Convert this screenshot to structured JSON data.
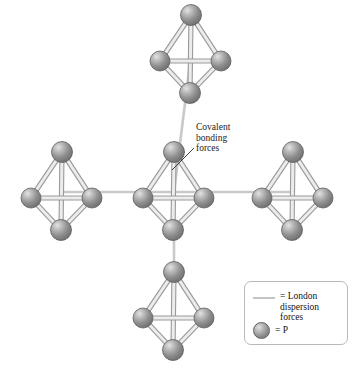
{
  "figure": {
    "background_color": "#ffffff"
  },
  "annotations": {
    "covalent": {
      "text": "Covalent\nbonding\nforces",
      "x": 196,
      "y": 122,
      "leader_from": [
        194,
        148
      ],
      "leader_to": [
        172,
        170
      ]
    }
  },
  "legend": {
    "box": {
      "x": 244,
      "y": 281,
      "width": 104,
      "height": 64,
      "border_color": "#b9b9b9"
    },
    "entries": [
      {
        "swatch": "line-swatch",
        "text": "= London\ndispersion\nforces",
        "color": "#c4c4c4"
      },
      {
        "swatch": "sphere-swatch",
        "text": "= P",
        "color": "#8c8c8c"
      }
    ]
  },
  "style": {
    "atom_fill": "#8a8a8a",
    "atom_highlight": "#d8d8d8",
    "atom_edge": "#5f5f5f",
    "bond_fill": "#d5d5d5",
    "bond_edge": "#9a9a9a",
    "intermolecular_line": "#c9c9c9",
    "text_color": "#141414"
  },
  "chart_data": {
    "type": "diagram",
    "molecule_formula": "P4",
    "molecule_geometry": "tetrahedral",
    "atoms_per_molecule": 4,
    "bonds_per_molecule": 6,
    "atom_label": "P",
    "molecules": [
      {
        "id": "top",
        "cx": 191,
        "cy": 55,
        "scale": 1.0
      },
      {
        "id": "left",
        "cx": 62,
        "cy": 192,
        "scale": 1.0
      },
      {
        "id": "center",
        "cx": 174,
        "cy": 192,
        "scale": 1.0
      },
      {
        "id": "right",
        "cx": 293,
        "cy": 192,
        "scale": 1.0
      },
      {
        "id": "bottom",
        "cx": 174,
        "cy": 312,
        "scale": 1.0
      }
    ],
    "intermolecular_connections": [
      {
        "from": "top",
        "to": "center",
        "type": "london-dispersion"
      },
      {
        "from": "left",
        "to": "center",
        "type": "london-dispersion"
      },
      {
        "from": "center",
        "to": "right",
        "type": "london-dispersion"
      },
      {
        "from": "center",
        "to": "bottom",
        "type": "london-dispersion"
      }
    ],
    "force_types": [
      "Covalent bonding forces",
      "London dispersion forces"
    ]
  }
}
